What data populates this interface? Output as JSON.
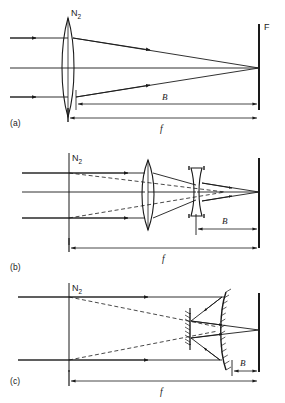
{
  "figure": {
    "stroke_color": "#1a1a1a",
    "background": "#ffffff",
    "panels": [
      {
        "id": "a",
        "label": "(a)",
        "caption": "Simple converging lens",
        "nodal_label": "N",
        "nodal_sub": "2",
        "focus_label": "F",
        "back_focal_label": "B",
        "focal_label": "f",
        "elements": [
          "biconvex-lens",
          "focal-plane-screen"
        ],
        "ray_style": "solid"
      },
      {
        "id": "b",
        "label": "(b)",
        "caption": "Telephoto lens: converging plus diverging element",
        "nodal_label": "N",
        "nodal_sub": "2",
        "back_focal_label": "B",
        "focal_label": "f",
        "elements": [
          "nodal-plane",
          "biconvex-lens",
          "biconcave-lens",
          "focal-plane-screen"
        ],
        "ray_style": "solid-and-dashed"
      },
      {
        "id": "c",
        "label": "(c)",
        "caption": "Mirror (catadioptric) telephoto system",
        "nodal_label": "N",
        "nodal_sub": "2",
        "back_focal_label": "B",
        "focal_label": "f",
        "elements": [
          "nodal-plane",
          "secondary-mirror",
          "primary-concave-mirror",
          "focal-plane-screen"
        ],
        "ray_style": "solid-and-dashed"
      }
    ]
  }
}
